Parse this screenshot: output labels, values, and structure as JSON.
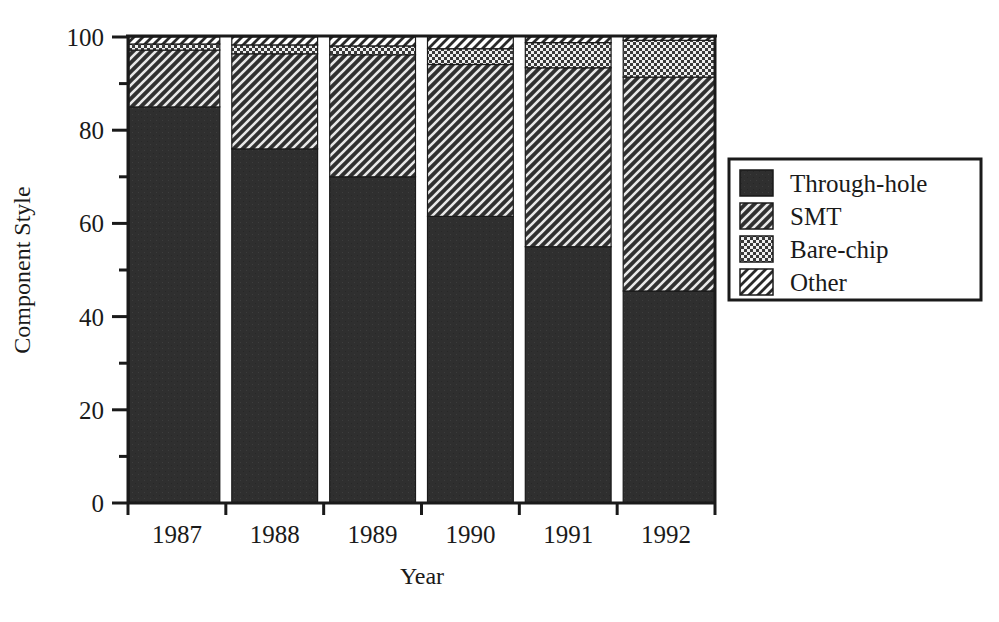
{
  "chart_data": {
    "type": "bar",
    "stacked": true,
    "stack_mode": "percent",
    "title": "",
    "xlabel": "Year",
    "ylabel": "Component Style",
    "categories": [
      "1987",
      "1988",
      "1989",
      "1990",
      "1991",
      "1992"
    ],
    "ylim": [
      0,
      100
    ],
    "yticks": [
      0,
      20,
      40,
      60,
      80,
      100
    ],
    "ytick_labels": [
      "0",
      "20",
      "40",
      "60",
      "80",
      "100"
    ],
    "yminorticks": [
      10,
      30,
      50,
      70,
      90
    ],
    "grid": false,
    "legend_position": "right",
    "series": [
      {
        "name": "Through-hole",
        "pattern": "solid-dark",
        "color": "#2e2e2e",
        "values": [
          85.0,
          76.0,
          70.0,
          61.5,
          55.0,
          45.5
        ]
      },
      {
        "name": "SMT",
        "pattern": "diagonal-hatch-dark",
        "color": "#3a3a3a",
        "values": [
          12.2,
          20.4,
          26.2,
          32.6,
          38.4,
          45.9
        ]
      },
      {
        "name": "Bare-chip",
        "pattern": "stipple-dots",
        "color": "#808080",
        "values": [
          1.3,
          1.9,
          1.9,
          3.4,
          5.4,
          7.9
        ]
      },
      {
        "name": "Other",
        "pattern": "diagonal-hatch-light",
        "color": "#ffffff",
        "values": [
          1.5,
          1.7,
          1.9,
          2.5,
          1.2,
          0.7
        ]
      }
    ]
  },
  "axes": {
    "y_title": "Component Style",
    "x_title": "Year"
  },
  "legend": {
    "entries": [
      {
        "label": "Through-hole",
        "pattern": "solid-dark"
      },
      {
        "label": "SMT",
        "pattern": "diagonal-hatch-dark"
      },
      {
        "label": "Bare-chip",
        "pattern": "stipple-dots"
      },
      {
        "label": "Other",
        "pattern": "diagonal-hatch-light"
      }
    ]
  }
}
